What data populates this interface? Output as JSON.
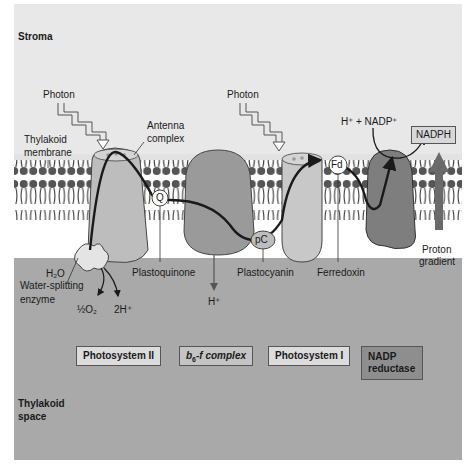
{
  "regions": {
    "stroma": "Stroma",
    "thylakoid_space_line1": "Thylakoid",
    "thylakoid_space_line2": "space",
    "membrane_line1": "Thylakoid",
    "membrane_line2": "membrane"
  },
  "labels": {
    "photon_left": "Photon",
    "photon_right": "Photon",
    "antenna_line1": "Antenna",
    "antenna_line2": "complex",
    "h_nadp": "H⁺ + NADP⁺",
    "nadph": "NADPH",
    "h2o": "H₂O",
    "water_enzyme_line1": "Water-splitting",
    "water_enzyme_line2": "enzyme",
    "half_o2": "½O₂",
    "two_h": "2H⁺",
    "plastoquinone": "Plastoquinone",
    "h_plus": "H⁺",
    "plastocyanin": "Plastocyanin",
    "ferredoxin": "Ferredoxin",
    "proton_line1": "Proton",
    "proton_line2": "gradient",
    "q": "Q",
    "pc": "pC",
    "fd": "Fd"
  },
  "complexes": [
    {
      "label": "Photosystem II"
    },
    {
      "label": "b6-f complex",
      "main": "b",
      "sub": "6",
      "rest": "-f complex"
    },
    {
      "label": "Photosystem I"
    },
    {
      "label_line1": "NADP",
      "label_line2": "reductase"
    }
  ],
  "colors": {
    "stroma_bg": "#e8e8e8",
    "lumen_bg": "#a9a9a9",
    "ps2": "#bdbdbd",
    "b6f": "#9a9a9a",
    "ps1": "#c8c8c8",
    "nadp_reductase": "#7e7e7e",
    "proton_arrow": "#6a6a6a",
    "electron_path": "#1a1a1a"
  }
}
